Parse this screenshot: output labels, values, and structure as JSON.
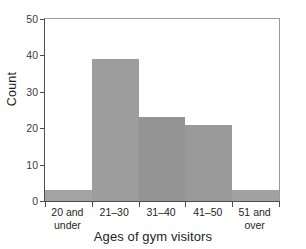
{
  "chart_data": {
    "type": "bar",
    "title": "",
    "xlabel": "Ages of gym visitors",
    "ylabel": "Count",
    "categories": [
      "20 and under",
      "21–30",
      "31–40",
      "41–50",
      "51 and over"
    ],
    "category_lines": [
      [
        "20 and",
        "under"
      ],
      [
        "21–30",
        ""
      ],
      [
        "31–40",
        ""
      ],
      [
        "41–50",
        ""
      ],
      [
        "51 and",
        "over"
      ]
    ],
    "values": [
      3,
      39,
      23,
      21,
      3
    ],
    "ylim": [
      0,
      50
    ],
    "yticks": [
      0,
      10,
      20,
      30,
      40,
      50
    ],
    "ytick_labels": [
      "0",
      "10",
      "20",
      "30",
      "40",
      "50"
    ],
    "grid": false,
    "legend": "none",
    "bar_color": "#9b9b9b",
    "axis_color": "#4d4d4d",
    "frame_color": "#9a9a9a",
    "text_color": "#231f20"
  }
}
